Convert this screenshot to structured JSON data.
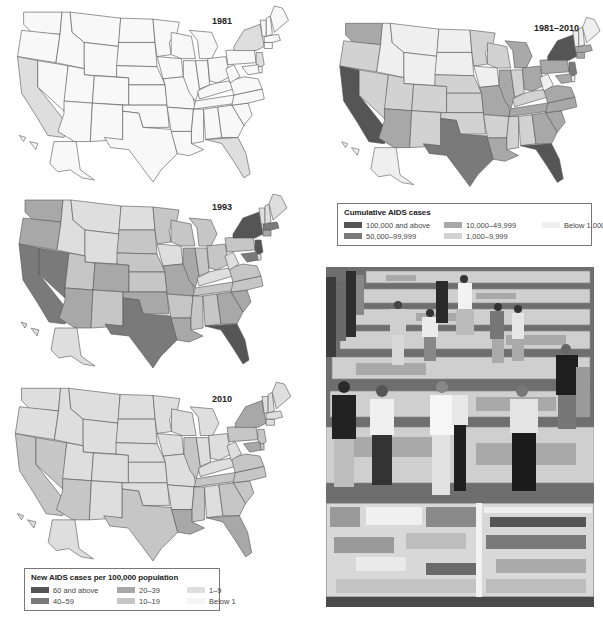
{
  "chart_data": [
    {
      "type": "choropleth",
      "title": "1981",
      "measure": "New AIDS cases per 100,000 population",
      "legend_ref": "new_cases_legend",
      "highlighted": {
        "10-19": [],
        "1-9": [
          "CA",
          "NY",
          "FL",
          "NJ"
        ],
        "Below 1": [
          "all other states"
        ]
      }
    },
    {
      "type": "choropleth",
      "title": "1981–2010",
      "measure": "Cumulative AIDS cases",
      "legend_ref": "cumulative_legend",
      "highlighted": {
        "100,000 and above": [
          "CA",
          "NY",
          "FL"
        ],
        "50,000–99,999": [
          "TX",
          "NJ"
        ],
        "10,000–49,999": [
          "WA",
          "AZ",
          "MO",
          "IL",
          "MI",
          "OH",
          "PA",
          "LA",
          "GA",
          "NC",
          "SC",
          "VA",
          "TN",
          "MD",
          "MA",
          "CT"
        ],
        "1,000–9,999": [
          "OR",
          "NV",
          "UT",
          "CO",
          "NM",
          "OK",
          "KS",
          "NE",
          "MN",
          "WI",
          "IN",
          "KY",
          "AL",
          "MS",
          "AR",
          "OR"
        ],
        "Below 1,000": [
          "MT",
          "ID",
          "WY",
          "ND",
          "SD",
          "ME",
          "VT",
          "NH",
          "WV",
          "IA"
        ]
      }
    },
    {
      "type": "choropleth",
      "title": "1993",
      "measure": "New AIDS cases per 100,000 population",
      "legend_ref": "new_cases_legend",
      "highlighted": {
        "60 and above": [
          "NY",
          "FL",
          "NJ"
        ],
        "40-59": [
          "CA",
          "NV",
          "TX",
          "MD",
          "MA"
        ],
        "20-39": [
          "WA",
          "OR",
          "AZ",
          "CO",
          "OK",
          "MO",
          "IL",
          "GA",
          "SC",
          "LA",
          "CT"
        ],
        "10-19": [
          "UT",
          "NM",
          "KS",
          "NE",
          "SD",
          "MN",
          "WI",
          "MI",
          "IN",
          "OH",
          "PA",
          "VA",
          "NC",
          "TN",
          "AL",
          "MS",
          "AR"
        ],
        "1-9": [
          "MT",
          "ID",
          "WY",
          "ND",
          "IA",
          "KY",
          "WV",
          "ME",
          "VT",
          "NH"
        ]
      }
    },
    {
      "type": "choropleth",
      "title": "2010",
      "measure": "New AIDS cases per 100,000 population",
      "legend_ref": "new_cases_legend",
      "highlighted": {
        "20-39": [
          "LA",
          "FL",
          "NY",
          "MD"
        ],
        "10-19": [
          "CA",
          "NV",
          "AZ",
          "TX",
          "IL",
          "GA",
          "SC",
          "MS",
          "NC",
          "VA",
          "TN",
          "PA",
          "NJ",
          "DE"
        ],
        "1-9": [
          "all other states"
        ]
      }
    }
  ],
  "maps": [
    {
      "id": "map-1981",
      "title": "1981"
    },
    {
      "id": "map-1981-2010",
      "title": "1981–2010"
    },
    {
      "id": "map-1993",
      "title": "1993"
    },
    {
      "id": "map-2010",
      "title": "2010"
    }
  ],
  "cumulative_legend": {
    "title": "Cumulative AIDS cases",
    "items": [
      {
        "label": "100,000 and above",
        "color": "#555555"
      },
      {
        "label": "50,000–99,999",
        "color": "#7a7a7a"
      },
      {
        "label": "10,000–49,999",
        "color": "#a8a8a8"
      },
      {
        "label": "1,000–9,999",
        "color": "#d2d2d2"
      },
      {
        "label": "Below 1,000",
        "color": "#efefef"
      }
    ]
  },
  "new_cases_legend": {
    "title": "New AIDS cases per 100,000 population",
    "items": [
      {
        "label": "60 and above",
        "color": "#555555"
      },
      {
        "label": "40–59",
        "color": "#7a7a7a"
      },
      {
        "label": "20–39",
        "color": "#a8a8a8"
      },
      {
        "label": "10–19",
        "color": "#c6c6c6"
      },
      {
        "label": "1–9",
        "color": "#dedede"
      },
      {
        "label": "Below 1",
        "color": "#f5f5f5"
      }
    ]
  },
  "photo": {
    "subject": "crowd walking among memorial quilt panels laid on the ground"
  }
}
